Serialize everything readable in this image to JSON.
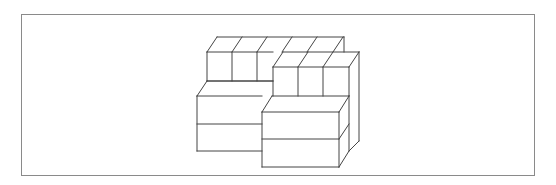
{
  "figure": {
    "stroke_color": "#444444",
    "frame_color": "#8a8a8a",
    "visible_cubes": {
      "back_top_row": 3,
      "second_row": 3,
      "left_lower_box_layers": 2,
      "front_lower_box_layers": 2
    }
  }
}
